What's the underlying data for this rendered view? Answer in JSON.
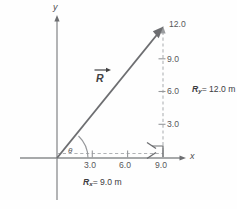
{
  "figure": {
    "axes": {
      "x_axis_label": "x",
      "y_axis_label": "y",
      "angle_label": "θ"
    },
    "x_ticks": [
      {
        "value": "3.0"
      },
      {
        "value": "6.0"
      },
      {
        "value": "9.0"
      }
    ],
    "y_ticks": [
      {
        "value": "3.0"
      },
      {
        "value": "6.0"
      },
      {
        "value": "9.0"
      },
      {
        "value": "12.0"
      }
    ],
    "vector": {
      "label": "R",
      "arrow_glyph": "→"
    },
    "components": {
      "x_component": {
        "symbol": "R",
        "subscript": "x",
        "equals": "= 9.0 m",
        "full_text": "Rₓ = 9.0 m"
      },
      "y_component": {
        "symbol": "R",
        "subscript": "y",
        "equals": "= 12.0 m",
        "full_text": "Rᵧ = 12.0 m"
      }
    },
    "colors": {
      "axis": "#808285",
      "vector": "#6d6e71",
      "dashed": "#a7a9ac",
      "text": "#58585a",
      "background": "#fefefe"
    }
  }
}
